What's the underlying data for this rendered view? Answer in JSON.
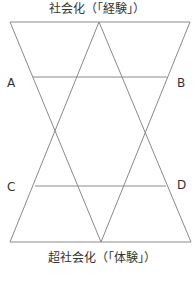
{
  "diagram": {
    "top_title": "社会化（「経験」）",
    "bottom_title": "超社会化（「体験」）",
    "labels": {
      "A": "A",
      "B": "B",
      "C": "C",
      "D": "D"
    },
    "line_color": "#8a8a8a",
    "shapes": {
      "downward_triangle": [
        [
          10,
          22
        ],
        [
          190,
          22
        ],
        [
          101,
          242
        ]
      ],
      "upward_triangle": [
        [
          10,
          242
        ],
        [
          191,
          242
        ],
        [
          99,
          22
        ]
      ],
      "line_AB": [
        [
          33,
          77
        ],
        [
          167,
          77
        ]
      ],
      "line_CD": [
        [
          35,
          186
        ],
        [
          166,
          186
        ]
      ]
    }
  }
}
